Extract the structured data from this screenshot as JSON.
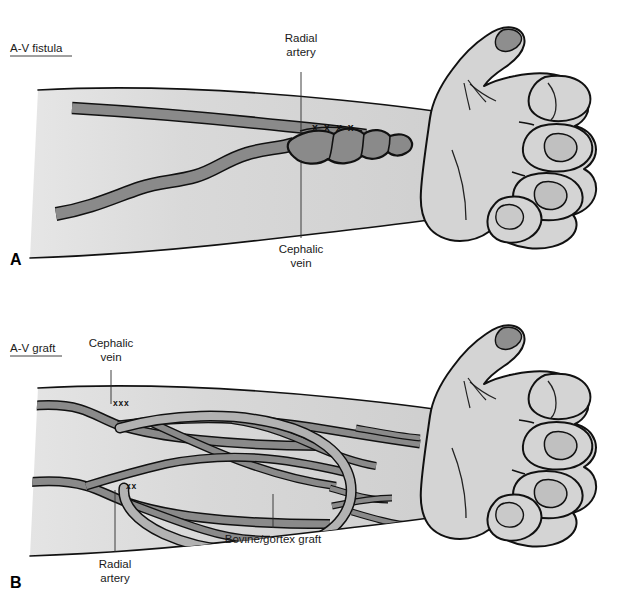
{
  "figure": {
    "background_color": "#ffffff",
    "skin_fill_light": "#d8d8d8",
    "skin_fill_dark": "#c4c4c4",
    "vessel_fill": "#8a8a8a",
    "graft_fill": "#b0b0b0",
    "outline_color": "#111111",
    "text_color": "#1a1a1a"
  },
  "panels": [
    {
      "letter": "A",
      "title": "A-V fistula",
      "labels": [
        {
          "text_line1": "Radial",
          "text_line2": "artery",
          "name": "radial-artery"
        },
        {
          "text_line1": "Cephalic",
          "text_line2": "vein",
          "name": "cephalic-vein"
        }
      ],
      "suture_marks": [
        {
          "text": "x x x x",
          "name": "anastomosis-sutures"
        }
      ]
    },
    {
      "letter": "B",
      "title": "A-V graft",
      "labels": [
        {
          "text_line1": "Cephalic",
          "text_line2": "vein",
          "name": "cephalic-vein"
        },
        {
          "text_line1": "Radial",
          "text_line2": "artery",
          "name": "radial-artery"
        },
        {
          "text_line1": "Bovine/gortex graft",
          "text_line2": "",
          "name": "bovine-gortex-graft"
        }
      ],
      "suture_marks": [
        {
          "text": "xxx",
          "name": "vein-anastomosis-sutures"
        },
        {
          "text": "xx",
          "name": "artery-anastomosis-sutures"
        }
      ]
    }
  ]
}
